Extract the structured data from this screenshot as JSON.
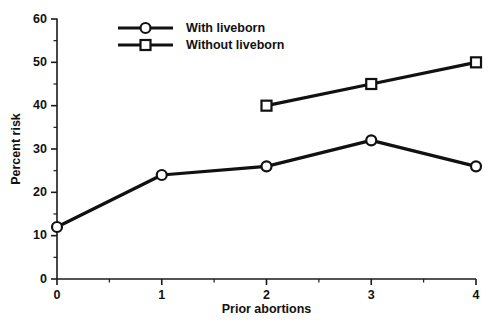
{
  "chart_data": {
    "type": "line",
    "title": "",
    "xlabel": "Prior abortions",
    "ylabel": "Percent risk",
    "xlim": [
      0,
      4
    ],
    "ylim": [
      0,
      60
    ],
    "grid": false,
    "legend_position": "top-center",
    "x_ticks": [
      "0",
      "1",
      "2",
      "3",
      "4"
    ],
    "x_tick_values": [
      0,
      1,
      2,
      3,
      4
    ],
    "x_minor_ticks": [
      0.5,
      1.5,
      2.5,
      3.5
    ],
    "y_ticks": [
      "0",
      "10",
      "20",
      "30",
      "40",
      "50",
      "60"
    ],
    "y_tick_values": [
      0,
      10,
      20,
      30,
      40,
      50,
      60
    ],
    "y_minor_ticks": [
      5,
      15,
      25,
      35,
      45,
      55
    ],
    "series": [
      {
        "name": "With liveborn",
        "marker": "circle",
        "x": [
          0,
          1,
          2,
          3,
          4
        ],
        "values": [
          12,
          24,
          26,
          32,
          26
        ]
      },
      {
        "name": "Without liveborn",
        "marker": "square",
        "x": [
          2,
          3,
          4
        ],
        "values": [
          40,
          45,
          50
        ]
      }
    ]
  },
  "legend": {
    "items": [
      {
        "label": "With liveborn",
        "marker": "circle"
      },
      {
        "label": "Without liveborn",
        "marker": "square"
      }
    ]
  },
  "colors": {
    "line": "#111111",
    "marker_fill": "#ffffff",
    "axis": "#1a1a1a",
    "background": "#ffffff"
  }
}
